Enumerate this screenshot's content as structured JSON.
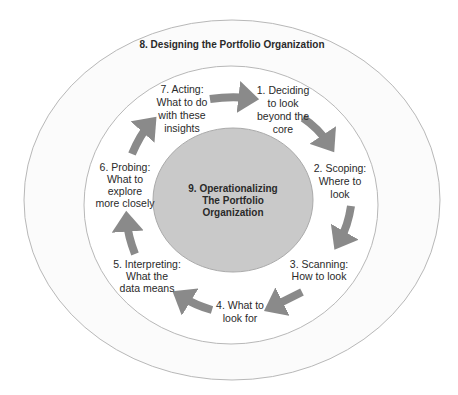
{
  "diagram": {
    "type": "cycle-in-concentric-circles",
    "colors": {
      "outer_ring_fill": "#fbfbfb",
      "inner_ring_fill": "#ffffff",
      "ring_stroke": "#b8b8b8",
      "core_fill": "#c9c9c9",
      "arrow": "#8a8a8a",
      "text": "#2a2a2a"
    },
    "outer_ring": {
      "label": "8. Designing the Portfolio Organization"
    },
    "core": {
      "lines": [
        "9. Operationalizing",
        "The Portfolio",
        "Organization"
      ]
    },
    "steps": [
      {
        "id": 1,
        "lines": [
          "1. Deciding",
          "to look",
          "beyond the",
          "core"
        ]
      },
      {
        "id": 2,
        "lines": [
          "2. Scoping:",
          "Where to",
          "look"
        ]
      },
      {
        "id": 3,
        "lines": [
          "3. Scanning:",
          "How to look"
        ]
      },
      {
        "id": 4,
        "lines": [
          "4. What to",
          "look for"
        ]
      },
      {
        "id": 5,
        "lines": [
          "5. Interpreting:",
          "What the",
          "data means"
        ]
      },
      {
        "id": 6,
        "lines": [
          "6. Probing:",
          "What to",
          "explore",
          "more closely"
        ]
      },
      {
        "id": 7,
        "lines": [
          "7. Acting:",
          "What to do",
          "with these",
          "insights"
        ]
      }
    ],
    "arrows": [
      {
        "from": 7,
        "to": 1
      },
      {
        "from": 1,
        "to": 2
      },
      {
        "from": 2,
        "to": 3
      },
      {
        "from": 3,
        "to": 4
      },
      {
        "from": 4,
        "to": 5
      },
      {
        "from": 5,
        "to": 6
      },
      {
        "from": 6,
        "to": 7
      }
    ]
  }
}
